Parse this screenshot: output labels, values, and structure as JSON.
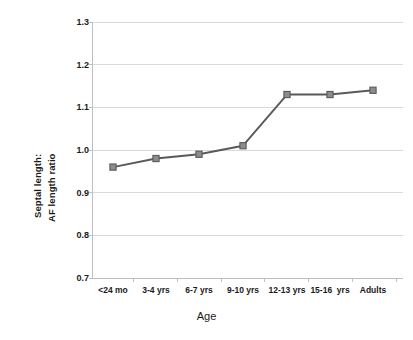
{
  "chart_data": {
    "type": "line",
    "title": "",
    "subtitle": "",
    "xlabel": "Age",
    "ylabel": "Septal length:\nAF length ratio",
    "ylabel_lines": [
      "Septal length:",
      "AF length ratio"
    ],
    "categories": [
      "<24 mo",
      "3-4 yrs",
      "6-7 yrs",
      "9-10 yrs",
      "12-13 yrs",
      "15-16  yrs",
      "Adults"
    ],
    "values": [
      0.96,
      0.98,
      0.99,
      1.01,
      1.13,
      1.13,
      1.14
    ],
    "series": [
      {
        "name": "Septal length: AF length ratio",
        "values": [
          0.96,
          0.98,
          0.99,
          1.01,
          1.13,
          1.13,
          1.14
        ]
      }
    ],
    "ylim": [
      0.7,
      1.3
    ],
    "yticks": [
      "0.7",
      "0.8",
      "0.9",
      "1.0",
      "1.1",
      "1.2",
      "1.3"
    ],
    "ytick_values": [
      0.7,
      0.8,
      0.9,
      1.0,
      1.1,
      1.2,
      1.3
    ],
    "grid": true,
    "grid_axis": "y",
    "legend": "none",
    "legend_position": "none",
    "marker": "square",
    "colors": {
      "line": "#595959",
      "marker_fill": "#8c8c8c",
      "marker_edge": "#595959",
      "grid": "#d9d9d9",
      "axis": "#bfbfbf",
      "text": "#1a1a1a",
      "background": "#ffffff"
    }
  }
}
